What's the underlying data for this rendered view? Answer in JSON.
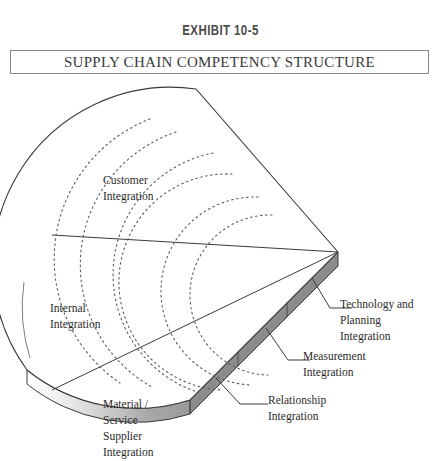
{
  "header": {
    "exhibit_number": "EXHIBIT 10-5",
    "title": "SUPPLY CHAIN COMPETENCY STRUCTURE"
  },
  "diagram": {
    "type": "wedge-3d",
    "wedge_sections": [
      {
        "id": "customer",
        "lines": [
          "Customer",
          "Integration"
        ]
      },
      {
        "id": "internal",
        "lines": [
          "Internal",
          "Integration"
        ]
      },
      {
        "id": "supplier",
        "lines": [
          "Material /",
          "Service",
          "Supplier",
          "Integration"
        ]
      }
    ],
    "edge_segments": [
      {
        "id": "technology-planning",
        "lines": [
          "Technology and",
          "Planning",
          "Integration"
        ]
      },
      {
        "id": "measurement",
        "lines": [
          "Measurement",
          "Integration"
        ]
      },
      {
        "id": "relationship",
        "lines": [
          "Relationship",
          "Integration"
        ]
      }
    ],
    "dotted_arc_count": 6,
    "colors": {
      "outline": "#3a3a3a",
      "edge_face": "#8c8c8c",
      "edge_face_dark": "#6e6e6e",
      "bottom_gradient_start": "#ffffff",
      "bottom_gradient_end": "#9a9a9a",
      "text": "#2b2b2b",
      "title_text": "#3a3a3a",
      "exhibit_text": "#4a4a4a"
    }
  },
  "labels": {
    "customer_l1": "Customer",
    "customer_l2": "Integration",
    "internal_l1": "Internal",
    "internal_l2": "Integration",
    "supplier_l1": "Material /",
    "supplier_l2": "Service",
    "supplier_l3": "Supplier",
    "supplier_l4": "Integration",
    "tech_l1": "Technology and",
    "tech_l2": "Planning",
    "tech_l3": "Integration",
    "meas_l1": "Measurement",
    "meas_l2": "Integration",
    "rel_l1": "Relationship",
    "rel_l2": "Integration"
  }
}
